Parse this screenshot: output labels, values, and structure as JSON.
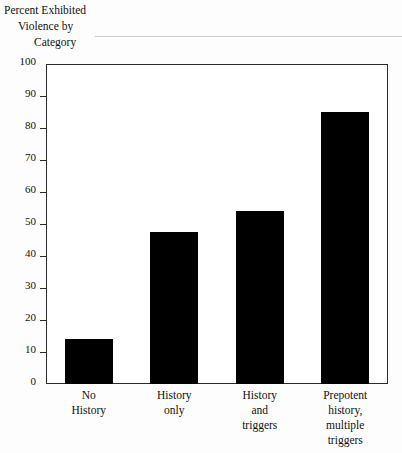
{
  "figure": {
    "title_lines": [
      "Percent Exhibited",
      "Violence by",
      "Category"
    ],
    "bar_color": "#000000",
    "frame_color": "#2b2b2b",
    "background": "#fdfdfd"
  },
  "chart_data": {
    "type": "bar",
    "title": "Percent Exhibited Violence by Category",
    "xlabel": "",
    "ylabel": "",
    "ylim": [
      0,
      100
    ],
    "yticks": [
      0,
      10,
      20,
      30,
      40,
      50,
      60,
      70,
      80,
      90,
      100
    ],
    "grid": false,
    "legend": "none",
    "categories": [
      "No History",
      "History only",
      "History and triggers",
      "Prepotent history, multiple triggers"
    ],
    "category_label_lines": [
      [
        "No",
        "History"
      ],
      [
        "History",
        "only"
      ],
      [
        "History",
        "and",
        "triggers"
      ],
      [
        "Prepotent",
        "history,",
        "multiple",
        "triggers"
      ]
    ],
    "values": [
      14,
      47.5,
      54,
      85
    ]
  }
}
